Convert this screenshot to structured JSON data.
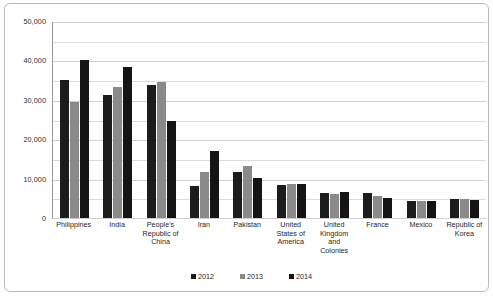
{
  "chart_data": {
    "type": "bar",
    "title": "",
    "xlabel": "",
    "ylabel": "",
    "ylim": [
      0,
      50000
    ],
    "y_ticks": [
      "0",
      "10,000",
      "20,000",
      "30,000",
      "40,000",
      "50,000"
    ],
    "y_tick_values": [
      0,
      10000,
      20000,
      30000,
      40000,
      50000
    ],
    "grid": true,
    "gridline_interval": 5000,
    "legend_position": "bottom",
    "categories": [
      "Philippines",
      "India",
      "People's Republic of China",
      "Iran",
      "Pakistan",
      "United States of America",
      "United Kingdom and Colonies",
      "France",
      "Mexico",
      "Republic of Korea"
    ],
    "series": [
      {
        "name": "2012",
        "color": "#1c1c1c",
        "values": [
          35000,
          31200,
          33700,
          8000,
          11800,
          8500,
          6300,
          6300,
          4200,
          4800
        ]
      },
      {
        "name": "2013",
        "color": "#8a8a8a",
        "values": [
          29500,
          33300,
          34600,
          11600,
          13300,
          8700,
          6200,
          5500,
          4200,
          4800
        ]
      },
      {
        "name": "2014",
        "color": "#141414",
        "values": [
          40000,
          38300,
          24700,
          17000,
          10200,
          8700,
          6500,
          5200,
          4400,
          4600
        ]
      }
    ]
  },
  "legend": {
    "items": [
      {
        "label": "2012",
        "color": "#1c1c1c"
      },
      {
        "label": "2013",
        "color": "#8a8a8a"
      },
      {
        "label": "2014",
        "color": "#141414"
      }
    ]
  }
}
